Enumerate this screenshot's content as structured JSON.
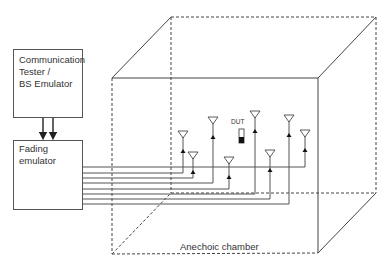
{
  "diagram": {
    "nodes": {
      "tester": {
        "label": "Communication\nTester /\nBS Emulator"
      },
      "fading": {
        "label": "Fading\nemulator"
      },
      "dut": {
        "label": "DUT"
      },
      "chamber": {
        "label": "Anechoic chamber"
      }
    },
    "edges": [
      {
        "from": "tester",
        "to": "fading",
        "count": 2,
        "style": "arrow"
      },
      {
        "from": "fading",
        "to": "antennas",
        "count": 8,
        "style": "cable"
      }
    ],
    "antennas": [
      {
        "id": 1,
        "x": 183,
        "y": 131,
        "cable_y": 173
      },
      {
        "id": 2,
        "x": 193,
        "y": 152,
        "cable_y": 178
      },
      {
        "id": 3,
        "x": 213,
        "y": 117,
        "cable_y": 183
      },
      {
        "id": 4,
        "x": 229,
        "y": 157,
        "cable_y": 189
      },
      {
        "id": 5,
        "x": 255,
        "y": 111,
        "cable_y": 194
      },
      {
        "id": 6,
        "x": 270,
        "y": 150,
        "cable_y": 199
      },
      {
        "id": 7,
        "x": 289,
        "y": 115,
        "cable_y": 204
      },
      {
        "id": 8,
        "x": 305,
        "y": 130,
        "cable_y": 167
      }
    ],
    "colors": {
      "line": "#444444",
      "box_border": "#555555",
      "text": "#333333"
    }
  }
}
